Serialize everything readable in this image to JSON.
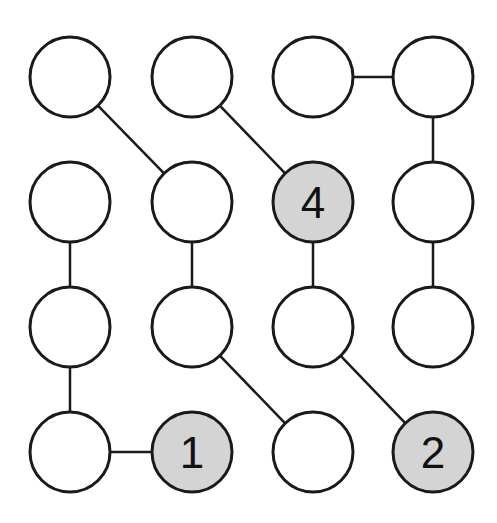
{
  "diagram": {
    "type": "grid-graph-puzzle",
    "rows": 4,
    "cols": 4,
    "col_x": [
      70,
      192,
      313,
      433
    ],
    "row_y": [
      77,
      202,
      327,
      452
    ],
    "radius": 40,
    "colors": {
      "stroke": "#1a1a1a",
      "empty_fill": "#ffffff",
      "shaded_fill": "#d4d4d4"
    },
    "nodes": [
      {
        "id": "r1c1",
        "row": 0,
        "col": 0,
        "label": "",
        "shaded": false
      },
      {
        "id": "r1c2",
        "row": 0,
        "col": 1,
        "label": "",
        "shaded": false
      },
      {
        "id": "r1c3",
        "row": 0,
        "col": 2,
        "label": "",
        "shaded": false
      },
      {
        "id": "r1c4",
        "row": 0,
        "col": 3,
        "label": "",
        "shaded": false
      },
      {
        "id": "r2c1",
        "row": 1,
        "col": 0,
        "label": "",
        "shaded": false
      },
      {
        "id": "r2c2",
        "row": 1,
        "col": 1,
        "label": "",
        "shaded": false
      },
      {
        "id": "r2c3",
        "row": 1,
        "col": 2,
        "label": "4",
        "shaded": true
      },
      {
        "id": "r2c4",
        "row": 1,
        "col": 3,
        "label": "",
        "shaded": false
      },
      {
        "id": "r3c1",
        "row": 2,
        "col": 0,
        "label": "",
        "shaded": false
      },
      {
        "id": "r3c2",
        "row": 2,
        "col": 1,
        "label": "",
        "shaded": false
      },
      {
        "id": "r3c3",
        "row": 2,
        "col": 2,
        "label": "",
        "shaded": false
      },
      {
        "id": "r3c4",
        "row": 2,
        "col": 3,
        "label": "",
        "shaded": false
      },
      {
        "id": "r4c1",
        "row": 3,
        "col": 0,
        "label": "",
        "shaded": false
      },
      {
        "id": "r4c2",
        "row": 3,
        "col": 1,
        "label": "1",
        "shaded": true
      },
      {
        "id": "r4c3",
        "row": 3,
        "col": 2,
        "label": "",
        "shaded": false
      },
      {
        "id": "r4c4",
        "row": 3,
        "col": 3,
        "label": "2",
        "shaded": true
      }
    ],
    "edges": [
      [
        "r1c1",
        "r2c2"
      ],
      [
        "r1c2",
        "r2c3"
      ],
      [
        "r1c3",
        "r1c4"
      ],
      [
        "r1c4",
        "r2c4"
      ],
      [
        "r2c1",
        "r3c1"
      ],
      [
        "r2c2",
        "r3c2"
      ],
      [
        "r2c3",
        "r3c3"
      ],
      [
        "r2c4",
        "r3c4"
      ],
      [
        "r3c1",
        "r4c1"
      ],
      [
        "r4c1",
        "r4c2"
      ],
      [
        "r3c2",
        "r4c3"
      ],
      [
        "r3c3",
        "r4c4"
      ]
    ]
  }
}
